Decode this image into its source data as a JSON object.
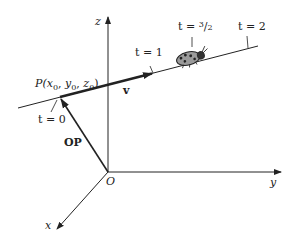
{
  "diagram": {
    "axes": {
      "z_label": "z",
      "y_label": "y",
      "x_label": "x",
      "origin_label": "O"
    },
    "point": {
      "label_prefix": "P(",
      "x": "x",
      "y": "y",
      "z": "z",
      "sub": "0",
      "sep": ", ",
      "close": ")"
    },
    "vectors": {
      "position_vector_label": "OP",
      "direction_vector_label": "v"
    },
    "parameter_ticks": [
      {
        "label": "t = 0"
      },
      {
        "label": "t = 1"
      },
      {
        "label_prefix": "t = ",
        "num": "3",
        "slash": "/",
        "den": "2"
      },
      {
        "label": "t = 2"
      }
    ],
    "ladybug": {
      "icon": "ladybug-icon"
    },
    "colors": {
      "line": "#222222",
      "ladybug_body": "#9a9a9a",
      "ladybug_spots": "#222222"
    }
  }
}
